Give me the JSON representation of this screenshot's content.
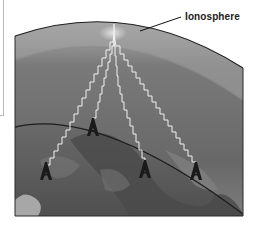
{
  "figure": {
    "labels": {
      "ionosphere": "Ionosphere"
    },
    "colors": {
      "sky_top": "#a9a9a9",
      "ionosphere_band": "#8e8e8e",
      "atmosphere": "#6e6e6e",
      "earth": "#5b5b5b",
      "signal": "#f2f2f2",
      "tower": "#1a1a1a",
      "outline": "#1e1e1e"
    },
    "elements": {
      "towers": [
        "tower-1",
        "tower-2",
        "tower-3",
        "tower-4"
      ],
      "signal_paths": 4,
      "reflection_point": "ionosphere-apex"
    }
  }
}
